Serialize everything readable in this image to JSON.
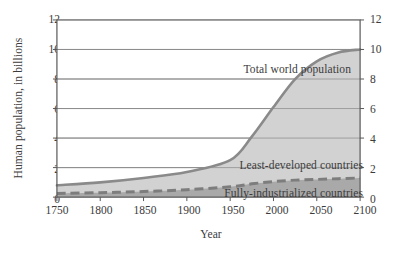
{
  "chart_data": {
    "type": "area",
    "title": "",
    "subtitle": "",
    "xlabel": "Year",
    "ylabel": "Human population, in billions",
    "xlim": [
      1750,
      2100
    ],
    "ylim": [
      0,
      12
    ],
    "xticks": [
      "1750",
      "1800",
      "1850",
      "1900",
      "1950",
      "2000",
      "2050",
      "2100"
    ],
    "yticks": [
      "0",
      "2",
      "4",
      "6",
      "8",
      "10",
      "12"
    ],
    "yticks_right": [
      "0",
      "2",
      "4",
      "6",
      "8",
      "10",
      "12"
    ],
    "grid": "horizontal",
    "legend_position": "inline-annotations",
    "x": [
      1750,
      1800,
      1850,
      1900,
      1950,
      1975,
      2000,
      2025,
      2050,
      2075,
      2100
    ],
    "series": [
      {
        "name": "Total world population",
        "style": "solid-line-filled",
        "color": "#8a8a8a",
        "fill": "#d2d2d2",
        "values": [
          0.8,
          1.0,
          1.3,
          1.7,
          2.5,
          4.1,
          6.1,
          8.0,
          9.2,
          9.8,
          10.0
        ]
      },
      {
        "name": "Least-developed countries",
        "style": "band",
        "fill": "#c9c9c9",
        "values": [
          0.55,
          0.7,
          0.95,
          1.25,
          1.9,
          3.4,
          5.3,
          7.1,
          8.2,
          8.7,
          8.8
        ]
      },
      {
        "name": "Fully-industrialized countries",
        "style": "dashed-line-filled",
        "color": "#7d7d7d",
        "fill": "#a9a9a9",
        "values": [
          0.25,
          0.3,
          0.38,
          0.5,
          0.7,
          0.9,
          1.05,
          1.15,
          1.2,
          1.25,
          1.3
        ]
      }
    ],
    "annotations": [
      {
        "text": "Total world population",
        "x": 1962,
        "y": 8.6
      },
      {
        "text": "Least-developed countries",
        "x": 2020,
        "y": 2.2
      },
      {
        "text": "Fully-industrialized countries",
        "x": 2020,
        "y": 0.35
      }
    ],
    "colors": {
      "frame": "#565656",
      "gridline": "#8c8c8c",
      "total_line": "#8a8a8a",
      "total_fill": "#d2d2d2",
      "industrial_line": "#7d7d7d",
      "industrial_fill": "#a9a9a9",
      "text": "#3b3b3b",
      "background": "#ffffff"
    }
  }
}
